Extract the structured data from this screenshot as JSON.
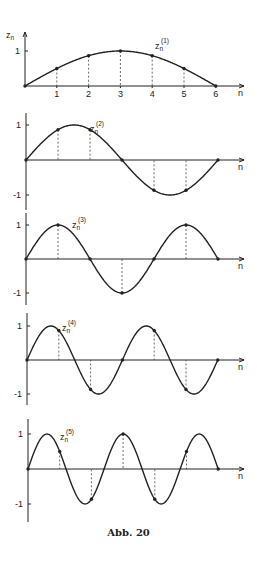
{
  "caption": "Abb. 20",
  "chart_data": [
    {
      "type": "line",
      "title": "z_n^(1)",
      "label_main": "z",
      "label_sub": "n",
      "label_sup": "(1)",
      "xlabel": "n",
      "ylabel": "z_n",
      "x": [
        0,
        1,
        2,
        3,
        4,
        5,
        6
      ],
      "values": [
        0,
        0.5,
        0.866,
        1,
        0.866,
        0.5,
        0
      ],
      "x_ticks": [
        "1",
        "2",
        "3",
        "4",
        "5",
        "6"
      ],
      "y_ticks": [
        "1"
      ],
      "ylim": [
        0,
        1
      ],
      "grid": false
    },
    {
      "type": "line",
      "title": "z_n^(2)",
      "label_main": "z",
      "label_sub": "n",
      "label_sup": "(2)",
      "xlabel": "n",
      "x": [
        0,
        1,
        2,
        3,
        4,
        5,
        6
      ],
      "values": [
        0,
        0.866,
        0.866,
        0,
        -0.866,
        -0.866,
        0
      ],
      "y_ticks": [
        "1",
        "-1"
      ],
      "ylim": [
        -1,
        1
      ],
      "grid": false
    },
    {
      "type": "line",
      "title": "z_n^(3)",
      "label_main": "z",
      "label_sub": "n",
      "label_sup": "(3)",
      "xlabel": "n",
      "x": [
        0,
        1,
        2,
        3,
        4,
        5,
        6
      ],
      "values": [
        0,
        1,
        0,
        -1,
        0,
        1,
        0
      ],
      "y_ticks": [
        "1",
        "-1"
      ],
      "ylim": [
        -1,
        1
      ],
      "grid": false
    },
    {
      "type": "line",
      "title": "z_n^(4)",
      "label_main": "z",
      "label_sub": "n",
      "label_sup": "(4)",
      "xlabel": "n",
      "x": [
        0,
        1,
        2,
        3,
        4,
        5,
        6
      ],
      "values": [
        0,
        0.866,
        -0.866,
        0,
        0.866,
        -0.866,
        0
      ],
      "y_ticks": [
        "1",
        "-1"
      ],
      "ylim": [
        -1,
        1
      ],
      "grid": false
    },
    {
      "type": "line",
      "title": "z_n^(5)",
      "label_main": "z",
      "label_sub": "n",
      "label_sup": "(5)",
      "xlabel": "n",
      "x": [
        0,
        1,
        2,
        3,
        4,
        5,
        6
      ],
      "values": [
        0,
        0.5,
        -0.866,
        1,
        -0.866,
        0.5,
        0
      ],
      "y_ticks": [
        "1",
        "-1"
      ],
      "ylim": [
        -1,
        1
      ],
      "grid": false
    }
  ]
}
